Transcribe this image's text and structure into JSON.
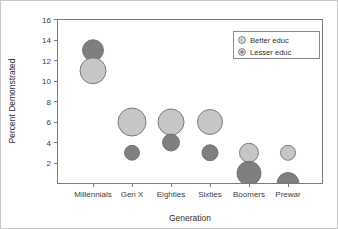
{
  "chart_data": {
    "type": "scatter",
    "title": "",
    "xlabel": "Generation",
    "ylabel": "Percent Demonstrated",
    "categories": [
      "Millennials",
      "Gen X",
      "Eighties",
      "Sixties",
      "Boomers",
      "Prewar"
    ],
    "ylim": [
      0,
      16
    ],
    "yticks": [
      2,
      4,
      6,
      8,
      10,
      12,
      14,
      16
    ],
    "ytick_labels": [
      "2",
      "4",
      "6",
      "8",
      "10",
      "12",
      "14",
      "16"
    ],
    "grid": false,
    "legend_position": "top-right",
    "series": [
      {
        "name": "Better educ",
        "color": "#c6c6c6",
        "values": [
          11,
          6,
          6,
          6,
          3,
          3
        ],
        "sizes": [
          26,
          28,
          26,
          25,
          19,
          15
        ]
      },
      {
        "name": "Lesser educ",
        "color": "#7f7f7f",
        "values": [
          13,
          3,
          4,
          3,
          1,
          0
        ],
        "sizes": [
          21,
          15,
          17,
          16,
          24,
          22
        ]
      }
    ],
    "points": [
      {
        "category": "Millennials",
        "series": "Lesser educ",
        "x": 92,
        "y": 13,
        "size": 21
      },
      {
        "category": "Millennials",
        "series": "Better educ",
        "x": 92,
        "y": 11,
        "size": 26
      },
      {
        "category": "Gen X",
        "series": "Better educ",
        "x": 131,
        "y": 6,
        "size": 28
      },
      {
        "category": "Gen X",
        "series": "Lesser educ",
        "x": 131,
        "y": 3,
        "size": 15
      },
      {
        "category": "Eighties",
        "series": "Better educ",
        "x": 170,
        "y": 6,
        "size": 26
      },
      {
        "category": "Eighties",
        "series": "Lesser educ",
        "x": 170,
        "y": 4,
        "size": 17
      },
      {
        "category": "Sixties",
        "series": "Better educ",
        "x": 209,
        "y": 6,
        "size": 25
      },
      {
        "category": "Sixties",
        "series": "Lesser educ",
        "x": 209,
        "y": 3,
        "size": 16
      },
      {
        "category": "Boomers",
        "series": "Better educ",
        "x": 248,
        "y": 3,
        "size": 19
      },
      {
        "category": "Boomers",
        "series": "Lesser educ",
        "x": 248,
        "y": 1,
        "size": 24
      },
      {
        "category": "Prewar",
        "series": "Better educ",
        "x": 287,
        "y": 3,
        "size": 15
      },
      {
        "category": "Prewar",
        "series": "Lesser educ",
        "x": 287,
        "y": 0,
        "size": 22
      }
    ],
    "legend": [
      {
        "label": "Better educ",
        "color": "#c6c6c6"
      },
      {
        "label": "Lesser educ",
        "color": "#7f7f7f"
      }
    ]
  }
}
